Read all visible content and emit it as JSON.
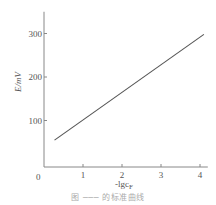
{
  "chart_data": {
    "type": "line",
    "title": "",
    "xlabel": "-lgc_F",
    "ylabel": "E/mV",
    "xlim": [
      0,
      4.2
    ],
    "ylim": [
      0,
      350
    ],
    "x_ticks": [
      0,
      1,
      2,
      3,
      4
    ],
    "y_ticks": [
      100,
      200,
      300
    ],
    "x_tick_labels": [
      "0",
      "1",
      "2",
      "3",
      "4"
    ],
    "y_tick_labels": [
      "100",
      "200",
      "300"
    ],
    "grid": false,
    "legend": null,
    "series": [
      {
        "name": "standard curve",
        "x": [
          0.27,
          4.1
        ],
        "y": [
          55,
          298
        ]
      }
    ]
  },
  "labels": {
    "ylabel": "E/mV",
    "xlabel_main": "-lgc",
    "xlabel_sub": "F",
    "origin": "0",
    "caption": "图 ─── 的标准曲线"
  },
  "colors": {
    "axis": "#888888",
    "line": "#555555",
    "text": "#555555"
  }
}
